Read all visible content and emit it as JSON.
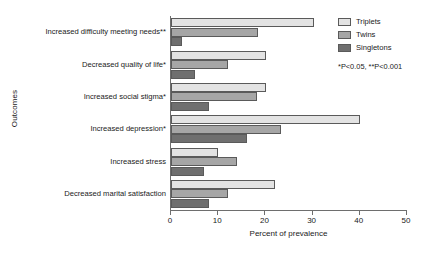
{
  "chart_data": {
    "type": "bar",
    "orientation": "horizontal",
    "title": "",
    "xlabel": "Percent of prevalence",
    "ylabel": "Outcomes",
    "xlim": [
      0,
      50
    ],
    "xticks": [
      0,
      10,
      20,
      30,
      40,
      50
    ],
    "grid": false,
    "legend_position": "top-right",
    "categories": [
      "Increased difficulty meeting needs**",
      "Decreased quality of life*",
      "Increased social stigma*",
      "Increased depression*",
      "Increased stress",
      "Decreased marital satisfaction"
    ],
    "series": [
      {
        "name": "Triplets",
        "color": "#e3e3e3",
        "values": [
          30.3,
          20.1,
          20.1,
          40.1,
          10.0,
          22.1
        ]
      },
      {
        "name": "Twins",
        "color": "#a6a6a6",
        "values": [
          18.4,
          12.0,
          18.2,
          23.3,
          14.0,
          12.0
        ]
      },
      {
        "name": "Singletons",
        "color": "#6f6f6f",
        "values": [
          2.4,
          5.0,
          8.0,
          16.2,
          7.0,
          8.0
        ]
      }
    ],
    "annotations": [
      "*P<0.05, **P<0.001"
    ]
  },
  "legend": {
    "items": [
      {
        "label": "Triplets"
      },
      {
        "label": "Twins"
      },
      {
        "label": "Singletons"
      }
    ]
  },
  "footnote": "*P<0.05, **P<0.001",
  "axis": {
    "x_title": "Percent of prevalence",
    "y_title": "Outcomes",
    "x_tick_labels": [
      "0",
      "10",
      "20",
      "30",
      "40",
      "50"
    ]
  }
}
